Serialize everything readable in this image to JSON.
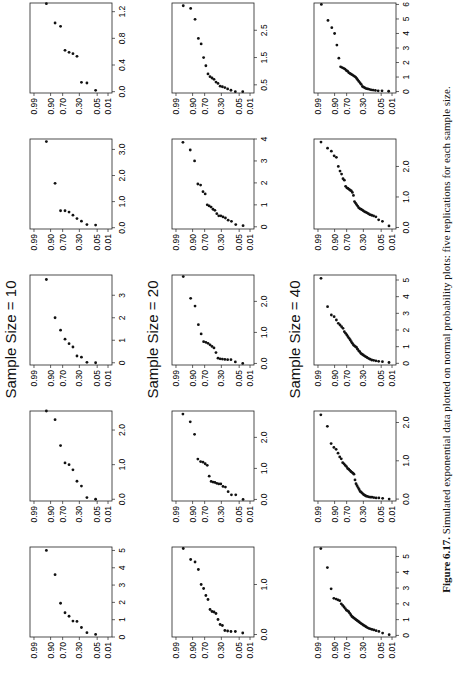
{
  "figure": {
    "caption_label": "Figure 6.17.",
    "caption_text": "Simulated exponential data plotted on normal probability plots: five replications for each sample size."
  },
  "chart_data": {
    "type": "scatter",
    "title": "Simulated exponential data plotted on normal probability plots",
    "y_tick_labels": [
      "0.01",
      "0.05",
      "0.30",
      "0.70",
      "0.90",
      "0.99"
    ],
    "ylabel": "Probability",
    "xlabel": "",
    "rows": [
      {
        "title": "Sample Size = 10",
        "n": 10,
        "panels": [
          {
            "xticks": [
              "0",
              "1",
              "2",
              "3",
              "4",
              "5"
            ],
            "xlim": [
              0,
              5.2
            ],
            "x": [
              0.15,
              0.25,
              0.55,
              0.9,
              0.92,
              1.2,
              1.4,
              1.95,
              3.6,
              5.0
            ]
          },
          {
            "xticks": [
              "0.0",
              "1.0",
              "2.0"
            ],
            "xlim": [
              -0.05,
              2.55
            ],
            "x": [
              0.0,
              0.05,
              0.38,
              0.52,
              0.85,
              1.0,
              1.05,
              1.55,
              2.3,
              2.55
            ]
          },
          {
            "xticks": [
              "0",
              "1",
              "2",
              "3"
            ],
            "xlim": [
              -0.1,
              3.9
            ],
            "x": [
              0.0,
              0.02,
              0.25,
              0.3,
              0.7,
              0.85,
              1.05,
              1.45,
              2.0,
              3.7
            ]
          },
          {
            "xticks": [
              "0.0",
              "1.0",
              "2.0",
              "3.0"
            ],
            "xlim": [
              -0.05,
              3.4
            ],
            "x": [
              0.1,
              0.12,
              0.25,
              0.35,
              0.48,
              0.6,
              0.65,
              0.65,
              1.7,
              3.3
            ]
          },
          {
            "xticks": [
              "0.0",
              "0.4",
              "0.8",
              "1.2"
            ],
            "xlim": [
              -0.02,
              1.33
            ],
            "x": [
              0.02,
              0.13,
              0.14,
              0.53,
              0.57,
              0.59,
              0.62,
              0.98,
              1.03,
              1.32
            ]
          }
        ]
      },
      {
        "title": "Sample Size = 20",
        "n": 20,
        "panels": [
          {
            "xticks": [
              "0.0",
              "1.0"
            ],
            "xlim": [
              -0.05,
              1.75
            ],
            "x": [
              0.03,
              0.06,
              0.06,
              0.07,
              0.08,
              0.18,
              0.2,
              0.3,
              0.42,
              0.45,
              0.46,
              0.5,
              0.7,
              0.78,
              0.92,
              1.0,
              1.3,
              1.45,
              1.5,
              1.72
            ]
          },
          {
            "xticks": [
              "0.0",
              "1.0",
              "2.0"
            ],
            "xlim": [
              -0.05,
              2.85
            ],
            "x": [
              0.0,
              0.15,
              0.15,
              0.25,
              0.4,
              0.42,
              0.5,
              0.5,
              0.52,
              0.55,
              0.56,
              0.58,
              0.75,
              1.1,
              1.15,
              1.2,
              1.22,
              1.3,
              2.1,
              2.5,
              2.75
            ]
          },
          {
            "xticks": [
              "0.0",
              "1.0",
              "2.0"
            ],
            "xlim": [
              -0.05,
              2.85
            ],
            "x": [
              0.0,
              0.05,
              0.12,
              0.12,
              0.13,
              0.14,
              0.15,
              0.17,
              0.35,
              0.5,
              0.55,
              0.6,
              0.65,
              0.68,
              0.7,
              0.95,
              1.25,
              1.85,
              2.1,
              2.8
            ]
          },
          {
            "xticks": [
              "0",
              "1",
              "2",
              "3",
              "4"
            ],
            "xlim": [
              -0.1,
              4.0
            ],
            "x": [
              0.05,
              0.1,
              0.25,
              0.3,
              0.4,
              0.45,
              0.5,
              0.5,
              0.6,
              0.75,
              0.8,
              0.9,
              0.95,
              1.0,
              1.5,
              1.6,
              1.9,
              1.95,
              3.0,
              3.5,
              3.85
            ]
          },
          {
            "xticks": [
              "0.5",
              "1.5",
              "2.5"
            ],
            "xlim": [
              0.2,
              3.5
            ],
            "x": [
              0.25,
              0.25,
              0.3,
              0.35,
              0.4,
              0.43,
              0.45,
              0.55,
              0.6,
              0.7,
              0.75,
              0.8,
              0.9,
              1.2,
              1.5,
              2.0,
              2.2,
              2.9,
              3.3,
              3.4
            ]
          }
        ]
      },
      {
        "title": "Sample Size = 40",
        "n": 40,
        "panels": [
          {
            "xticks": [
              "0",
              "1",
              "2",
              "3",
              "4",
              "5"
            ],
            "xlim": [
              -0.1,
              5.6
            ],
            "x": [
              0.05,
              0.15,
              0.25,
              0.3,
              0.35,
              0.38,
              0.42,
              0.45,
              0.5,
              0.55,
              0.6,
              0.65,
              0.7,
              0.75,
              0.8,
              0.85,
              0.9,
              0.95,
              1.0,
              1.05,
              1.1,
              1.15,
              1.2,
              1.3,
              1.4,
              1.5,
              1.55,
              1.6,
              1.7,
              1.8,
              1.9,
              2.0,
              2.2,
              2.25,
              2.3,
              2.35,
              2.95,
              4.3,
              5.5
            ]
          },
          {
            "xticks": [
              "0.0",
              "1.0",
              "2.0"
            ],
            "xlim": [
              -0.05,
              2.3
            ],
            "x": [
              0.0,
              0.02,
              0.03,
              0.03,
              0.04,
              0.05,
              0.05,
              0.06,
              0.07,
              0.08,
              0.1,
              0.12,
              0.15,
              0.18,
              0.2,
              0.25,
              0.3,
              0.35,
              0.4,
              0.5,
              0.65,
              0.68,
              0.7,
              0.72,
              0.75,
              0.78,
              0.8,
              0.85,
              0.88,
              0.92,
              0.95,
              1.05,
              1.1,
              1.2,
              1.3,
              1.35,
              1.45,
              1.9,
              2.2
            ]
          },
          {
            "xticks": [
              "0",
              "1",
              "2",
              "3",
              "4",
              "5"
            ],
            "xlim": [
              -0.1,
              5.3
            ],
            "x": [
              0.05,
              0.1,
              0.12,
              0.15,
              0.18,
              0.2,
              0.25,
              0.3,
              0.35,
              0.4,
              0.45,
              0.5,
              0.55,
              0.6,
              0.7,
              0.75,
              0.85,
              0.95,
              1.0,
              1.05,
              1.1,
              1.2,
              1.3,
              1.4,
              1.5,
              1.6,
              1.7,
              1.8,
              1.9,
              2.1,
              2.2,
              2.3,
              2.4,
              2.6,
              2.8,
              2.9,
              3.4,
              5.1
            ]
          },
          {
            "xticks": [
              "0.0",
              "1.0",
              "2.0"
            ],
            "xlim": [
              -0.05,
              2.9
            ],
            "x": [
              0.05,
              0.2,
              0.25,
              0.35,
              0.38,
              0.4,
              0.42,
              0.45,
              0.48,
              0.5,
              0.52,
              0.55,
              0.58,
              0.6,
              0.62,
              0.65,
              0.7,
              0.75,
              0.8,
              0.85,
              1.05,
              1.15,
              1.2,
              1.22,
              1.25,
              1.28,
              1.3,
              1.35,
              1.55,
              1.6,
              1.75,
              1.85,
              2.0,
              2.3,
              2.35,
              2.5,
              2.6,
              2.8
            ]
          },
          {
            "xticks": [
              "0",
              "1",
              "2",
              "3",
              "4",
              "5",
              "6"
            ],
            "xlim": [
              -0.1,
              6.1
            ],
            "x": [
              0.02,
              0.05,
              0.05,
              0.08,
              0.1,
              0.12,
              0.15,
              0.18,
              0.2,
              0.25,
              0.3,
              0.35,
              0.5,
              0.6,
              0.7,
              0.8,
              0.9,
              1.0,
              1.05,
              1.1,
              1.15,
              1.2,
              1.25,
              1.3,
              1.4,
              1.45,
              1.55,
              1.6,
              1.65,
              1.7,
              2.3,
              3.2,
              4.0,
              4.4,
              4.9,
              6.0
            ]
          }
        ]
      }
    ]
  }
}
